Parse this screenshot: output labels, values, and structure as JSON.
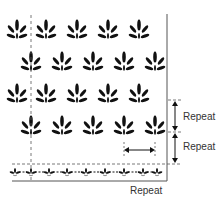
{
  "diagram": {
    "motif": "leaf-spray",
    "rows": [
      {
        "y": 32,
        "x": [
          17,
          46,
          77,
          108,
          139
        ],
        "partial_first": true
      },
      {
        "y": 64,
        "x": [
          31,
          62,
          93,
          124,
          155
        ],
        "partial_first": false
      },
      {
        "y": 96,
        "x": [
          17,
          46,
          77,
          108,
          139
        ],
        "partial_first": true
      },
      {
        "y": 128,
        "x": [
          31,
          62,
          93,
          124,
          155
        ],
        "partial_first": false
      }
    ],
    "border_row": {
      "y": 172,
      "motif_x": [
        15,
        31,
        49,
        67,
        86,
        105,
        124,
        143,
        157
      ]
    },
    "labels": {
      "vertical_repeat_1": "Repeat",
      "vertical_repeat_2": "Repeat",
      "horizontal_repeat": "Repeat"
    },
    "colors": {
      "ink": "#111111",
      "line": "#555555",
      "text": "#333333"
    }
  }
}
